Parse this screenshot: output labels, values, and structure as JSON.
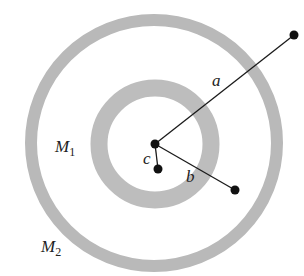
{
  "diagram": {
    "colors": {
      "shell": "#b8b8b8",
      "line": "#1a1a1a",
      "dot": "#111111",
      "background": "#ffffff"
    },
    "center": {
      "x": 155,
      "y": 144
    },
    "shells": [
      {
        "name": "M1",
        "label_main": "M",
        "label_sub": "1",
        "radius": 56,
        "thickness": 17
      },
      {
        "name": "M2",
        "label_main": "M",
        "label_sub": "2",
        "radius": 123,
        "thickness": 12
      }
    ],
    "points": [
      {
        "label": "a",
        "x": 294,
        "y": 35
      },
      {
        "label": "b",
        "x": 235,
        "y": 190
      },
      {
        "label": "c",
        "x": 158,
        "y": 169
      }
    ]
  }
}
